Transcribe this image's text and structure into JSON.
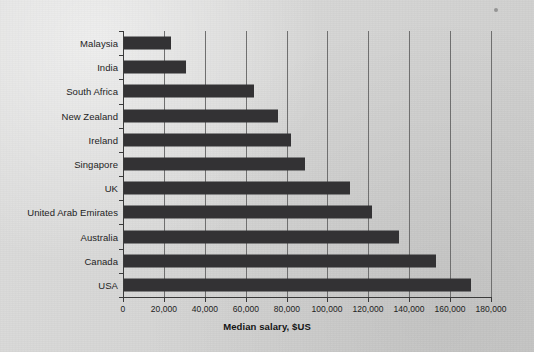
{
  "chart_data": {
    "type": "bar",
    "orientation": "horizontal",
    "title": "",
    "xlabel": "Median salary, $US",
    "ylabel": "",
    "categories": [
      "Malaysia",
      "India",
      "South Africa",
      "New Zealand",
      "Ireland",
      "Singapore",
      "UK",
      "United Arab Emirates",
      "Australia",
      "Canada",
      "USA"
    ],
    "values": [
      23500,
      31000,
      64000,
      76000,
      82000,
      89000,
      111000,
      122000,
      135000,
      153000,
      170000
    ],
    "xlim": [
      0,
      180000
    ],
    "xticks": [
      0,
      20000,
      40000,
      60000,
      80000,
      100000,
      120000,
      140000,
      160000,
      180000
    ],
    "xtick_labels": [
      "0",
      "20,000",
      "40,000",
      "60,000",
      "80,000",
      "100,000",
      "120,000",
      "140,000",
      "160,000",
      "180,000"
    ],
    "grid": "vertical",
    "legend": "none",
    "bar_color": "#333234",
    "gridline_color": "#6f6f6f",
    "axis_color": "#3a3a3a",
    "background_color": "#d4d4d3"
  }
}
